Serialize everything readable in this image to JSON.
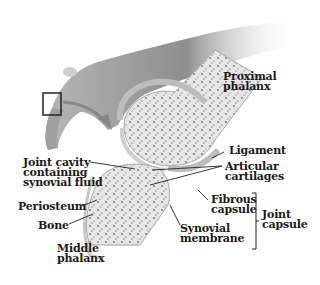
{
  "diagram": {
    "labels": {
      "proximal_phalanx": "Proximal\nphalanx",
      "ligament": "Ligament",
      "articular_cartilages": "Articular\ncartilages",
      "joint_cavity": "Joint cavity\ncontaining\nsynovial fluid",
      "fibrous_capsule": "Fibrous\ncapsule",
      "joint_capsule": "Joint\ncapsule",
      "periosteum": "Periosteum",
      "bone": "Bone",
      "synovial_membrane": "Synovial\nmembrane",
      "middle_phalanx": "Middle\nphalanx"
    },
    "colors": {
      "bone_fill": "#e9e9e9",
      "bone_speckle": "#6d6d6d",
      "capsule": "#d4d4d4",
      "hand_shade": "#8a8a8a",
      "text": "#1a1a1a"
    }
  }
}
